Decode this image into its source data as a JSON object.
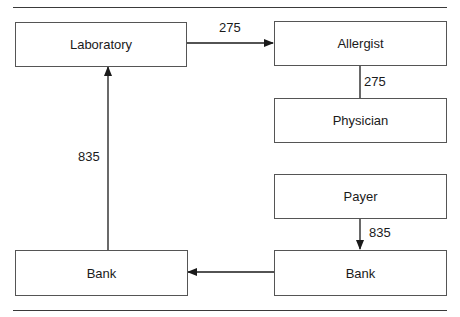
{
  "diagram": {
    "nodes": {
      "laboratory": "Laboratory",
      "allergist": "Allergist",
      "physician": "Physician",
      "payer": "Payer",
      "bank_left": "Bank",
      "bank_right": "Bank"
    },
    "edges": {
      "lab_to_allergist": "275",
      "allergist_physician": "275",
      "bank_to_lab": "835",
      "payer_to_bank": "835"
    },
    "colors": {
      "line": "#1a1a1a",
      "box_border": "#555555",
      "rule": "#3a3a3a"
    }
  }
}
